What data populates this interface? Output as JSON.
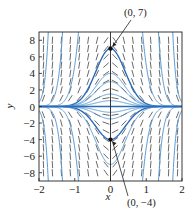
{
  "chart_data": {
    "type": "line",
    "title": "",
    "xlabel": "x",
    "ylabel": "y",
    "xlim": [
      -2,
      2
    ],
    "ylim": [
      -9,
      9
    ],
    "xticks": [
      -2,
      -1,
      0,
      1,
      2
    ],
    "yticks": [
      -8,
      -6,
      -4,
      -2,
      0,
      2,
      4,
      6,
      8
    ],
    "xtick_labels": [
      "−2",
      "−1",
      "0",
      "1",
      "2"
    ],
    "ytick_labels": [
      "−8",
      "−6",
      "−4",
      "−2",
      "0",
      "2",
      "4",
      "6",
      "8"
    ],
    "slope_field": {
      "description": "direction field of dy/dx = -6xy",
      "x_step": 0.25,
      "y_step": 1
    },
    "series": [
      {
        "name": "solution C=7",
        "form": "y = C·exp(-3x^2)",
        "C": 7,
        "emphasis": true
      },
      {
        "name": "solution C=-4",
        "form": "y = C·exp(-3x^2)",
        "C": -4,
        "emphasis": true
      },
      {
        "name": "solution C=4",
        "C": 4
      },
      {
        "name": "solution C=3",
        "C": 3
      },
      {
        "name": "solution C=1.5",
        "C": 1.5
      },
      {
        "name": "solution C=0.7",
        "C": 0.7
      },
      {
        "name": "solution C=-0.7",
        "C": -0.7
      },
      {
        "name": "solution C=-1.5",
        "C": -1.5
      },
      {
        "name": "solution C=-7",
        "C": -7
      },
      {
        "name": "solution C=100",
        "C": 100
      },
      {
        "name": "solution C=-100",
        "C": -100
      },
      {
        "name": "solution C=2000",
        "C": 2000
      },
      {
        "name": "solution C=-2000",
        "C": -2000
      },
      {
        "name": "solution C=80000",
        "C": 80000
      },
      {
        "name": "solution C=-80000",
        "C": -80000
      }
    ],
    "points": [
      {
        "x": 0,
        "y": 7,
        "label": "(0, 7)"
      },
      {
        "x": 0,
        "y": -4,
        "label": "(0, −4)"
      }
    ],
    "grid": false,
    "legend": "none",
    "colors": {
      "curve": "#2b6cb8",
      "curve_light": "#5b9bd5",
      "field": "#444444",
      "axis": "#222222"
    }
  }
}
